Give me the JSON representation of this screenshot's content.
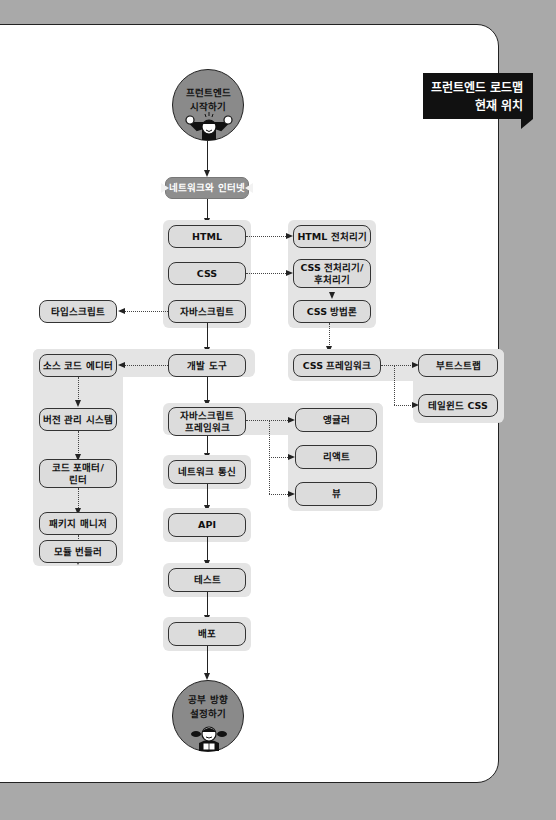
{
  "banner": {
    "line1": "프런트엔드 로드맵",
    "line2": "현재 위치"
  },
  "start": {
    "line1": "프런트엔드",
    "line2": "시작하기",
    "icon": "cheering-person-icon"
  },
  "end": {
    "line1": "공부 방향",
    "line2": "설정하기",
    "icon": "reading-person-icon"
  },
  "nodes": {
    "network": "네트워크와 인터넷",
    "html": "HTML",
    "css": "CSS",
    "javascript": "자바스크립트",
    "dev_tools": "개발 도구",
    "js_framework_1": "자바스크립트",
    "js_framework_2": "프레임워크",
    "network_comm": "네트워크 통신",
    "api": "API",
    "test": "테스트",
    "deploy": "배포",
    "html_preprocessor": "HTML 전처리기",
    "css_preprocessor_1": "CSS 전처리기/",
    "css_preprocessor_2": "후처리기",
    "css_methodology": "CSS 방법론",
    "css_framework": "CSS 프레임워크",
    "bootstrap": "부트스트랩",
    "tailwind": "테일윈드 CSS",
    "typescript": "타입스크립트",
    "source_editor": "소스 코드 에디터",
    "vcs": "버전 관리 시스템",
    "formatter_1": "코드 포매터/",
    "formatter_2": "린터",
    "package_manager": "패키지 매니저",
    "module_bundler": "모듈 번들러",
    "angular": "앵귤러",
    "react": "리액트",
    "vue": "뷰"
  },
  "colors": {
    "page_bg": "#a9a9a9",
    "card_bg": "#ffffff",
    "group_bg": "#e4e4e4",
    "node_bg": "#dcdcdc",
    "highlight_node": "#8e8e8e",
    "banner_bg": "#111111"
  }
}
